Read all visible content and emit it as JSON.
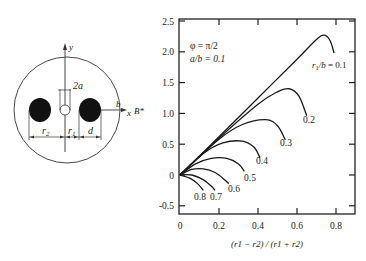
{
  "diagram": {
    "labels": {
      "y_axis": "y",
      "x_axis": "x",
      "aperture": "2a",
      "radius_b": "b",
      "field": "B*",
      "r2": "r",
      "r2_sub": "2",
      "r1": "r",
      "r1_sub": "1",
      "d": "d"
    }
  },
  "chart_data": {
    "type": "line",
    "title": "",
    "xlabel": "(r1 − r2) / (r1 + r2)",
    "ylabel": "",
    "xlim": [
      0,
      0.9
    ],
    "ylim": [
      -0.65,
      2.5
    ],
    "xticks": [
      "0",
      "0.2",
      "0.4",
      "0.6",
      "0.8"
    ],
    "yticks": [
      "2.5",
      "2.0",
      "1.5",
      "1.0",
      "0.5",
      "0",
      "-0.5"
    ],
    "grid": false,
    "annotations": [
      "φ = π/2",
      "a/b = 0.1"
    ],
    "series": [
      {
        "name": "r1/b = 0.1",
        "label": "r1/b = 0.1",
        "points": [
          [
            0,
            0
          ],
          [
            0.2,
            0.62
          ],
          [
            0.4,
            1.25
          ],
          [
            0.6,
            1.88
          ],
          [
            0.7,
            2.2
          ],
          [
            0.74,
            2.27
          ],
          [
            0.77,
            2.18
          ],
          [
            0.79,
            1.98
          ]
        ]
      },
      {
        "name": "0.2",
        "label": "0.2",
        "points": [
          [
            0,
            0
          ],
          [
            0.2,
            0.6
          ],
          [
            0.4,
            1.15
          ],
          [
            0.5,
            1.35
          ],
          [
            0.56,
            1.4
          ],
          [
            0.61,
            1.28
          ],
          [
            0.65,
            0.96
          ]
        ]
      },
      {
        "name": "0.3",
        "label": "0.3",
        "points": [
          [
            0,
            0
          ],
          [
            0.2,
            0.58
          ],
          [
            0.32,
            0.82
          ],
          [
            0.44,
            0.9
          ],
          [
            0.5,
            0.8
          ],
          [
            0.54,
            0.57
          ]
        ]
      },
      {
        "name": "0.4",
        "label": "0.4",
        "points": [
          [
            0,
            0
          ],
          [
            0.12,
            0.35
          ],
          [
            0.22,
            0.52
          ],
          [
            0.32,
            0.55
          ],
          [
            0.38,
            0.45
          ],
          [
            0.41,
            0.28
          ]
        ]
      },
      {
        "name": "0.5",
        "label": "0.5",
        "points": [
          [
            0,
            0
          ],
          [
            0.08,
            0.18
          ],
          [
            0.16,
            0.27
          ],
          [
            0.24,
            0.27
          ],
          [
            0.3,
            0.18
          ],
          [
            0.33,
            0.06
          ]
        ]
      },
      {
        "name": "0.6",
        "label": "0.6",
        "points": [
          [
            0,
            0
          ],
          [
            0.06,
            0.09
          ],
          [
            0.12,
            0.1
          ],
          [
            0.18,
            0.04
          ],
          [
            0.23,
            -0.08
          ],
          [
            0.25,
            -0.14
          ]
        ]
      },
      {
        "name": "0.7",
        "label": "0.7",
        "points": [
          [
            0,
            0
          ],
          [
            0.06,
            0.0
          ],
          [
            0.12,
            -0.08
          ],
          [
            0.16,
            -0.18
          ],
          [
            0.18,
            -0.25
          ]
        ]
      },
      {
        "name": "0.8",
        "label": "0.8",
        "points": [
          [
            0,
            0
          ],
          [
            0.05,
            -0.05
          ],
          [
            0.09,
            -0.14
          ],
          [
            0.12,
            -0.25
          ]
        ]
      }
    ]
  }
}
